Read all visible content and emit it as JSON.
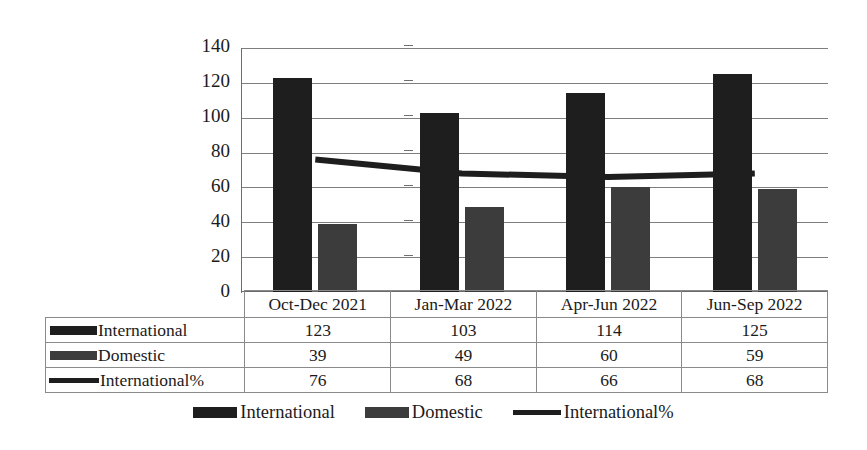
{
  "chart_data": {
    "type": "bar",
    "title": "",
    "subtitle": "",
    "xlabel": "",
    "ylabel": "",
    "ylim": [
      0,
      140
    ],
    "yticks": [
      0,
      20,
      40,
      60,
      80,
      100,
      120,
      140
    ],
    "grid": true,
    "legend_position": "bottom",
    "categories": [
      "Oct-Dec 2021",
      "Jan-Mar 2022",
      "Apr-Jun 2022",
      "Jun-Sep 2022"
    ],
    "series": [
      {
        "name": "International",
        "type": "bar",
        "values": [
          123,
          103,
          114,
          125
        ],
        "color": "#1e1e1e"
      },
      {
        "name": "Domestic",
        "type": "bar",
        "values": [
          39,
          49,
          60,
          59
        ],
        "color": "#3c3c3c"
      },
      {
        "name": "International%",
        "type": "line",
        "values": [
          76,
          68,
          66,
          68
        ],
        "color": "#1e1e1e"
      }
    ]
  },
  "yaxis": {
    "ticks": [
      "140",
      "120",
      "100",
      "80",
      "60",
      "40",
      "20",
      "0"
    ]
  },
  "table": {
    "columns": [
      "Oct-Dec 2021",
      "Jan-Mar 2022",
      "Apr-Jun 2022",
      "Jun-Sep 2022"
    ],
    "rows": [
      {
        "label": "International",
        "marker": "bar-dark",
        "values": [
          "123",
          "103",
          "114",
          "125"
        ]
      },
      {
        "label": "Domestic",
        "marker": "bar-gray",
        "values": [
          "39",
          "49",
          "60",
          "59"
        ]
      },
      {
        "label": "International%",
        "marker": "line-dark",
        "values": [
          "76",
          "68",
          "66",
          "68"
        ]
      }
    ]
  },
  "legend": {
    "items": [
      {
        "label": "International",
        "marker": "bar-dark"
      },
      {
        "label": "Domestic",
        "marker": "bar-gray"
      },
      {
        "label": "International%",
        "marker": "line-dark"
      }
    ]
  },
  "colors": {
    "international": "#1e1e1e",
    "domestic": "#3c3c3c",
    "international_pct": "#1e1e1e",
    "gridline": "#7e7e7e",
    "text": "#1b1b1b"
  }
}
